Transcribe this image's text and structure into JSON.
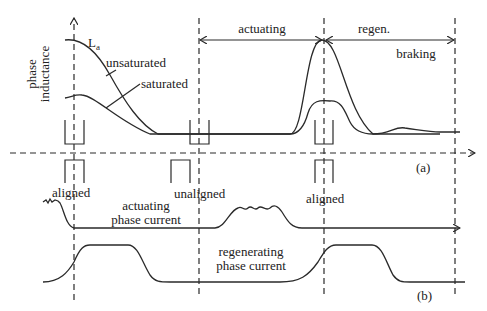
{
  "figure": {
    "panel_a": {
      "label": "(a)",
      "y_axis_label_line1": "phase",
      "y_axis_label_line2": "inductance",
      "curve_label_symbol": "L",
      "curve_label_subscript": "a",
      "unsaturated_label": "unsaturated",
      "saturated_label": "saturated",
      "region_actuating": "actuating",
      "region_regen": "regen.",
      "region_braking": "braking"
    },
    "panel_b": {
      "label": "(b)",
      "aligned_left": "aligned",
      "unaligned": "unaligned",
      "aligned_right": "aligned",
      "actuating_current_line1": "actuating",
      "actuating_current_line2": "phase current",
      "regenerating_current_line1": "regenerating",
      "regenerating_current_line2": "phase current"
    },
    "colors": {
      "line": "#2a2a2a",
      "background": "#ffffff"
    }
  }
}
